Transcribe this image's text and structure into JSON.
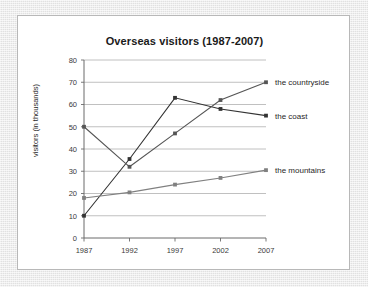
{
  "slide": {
    "panel_name": "chart-slide"
  },
  "chart_data": {
    "type": "line",
    "title": "Overseas visitors (1987-2007)",
    "xlabel": "",
    "ylabel": "visitors (in thousands)",
    "categories": [
      "1987",
      "1992",
      "1997",
      "2002",
      "2007"
    ],
    "ylim": [
      0,
      80
    ],
    "ytick_step": 10,
    "yticks": [
      "0",
      "10",
      "20",
      "30",
      "40",
      "50",
      "60",
      "70",
      "80"
    ],
    "grid": true,
    "grid_axis": "y",
    "legend_position": "right-end-labels",
    "series": [
      {
        "name": "the coast",
        "values": [
          10,
          35.5,
          63,
          58,
          55
        ],
        "color": "#333333",
        "marker": "square",
        "end_label": "the coast"
      },
      {
        "name": "the countryside",
        "values": [
          50,
          32,
          47,
          62,
          70
        ],
        "color": "#555555",
        "marker": "square",
        "end_label": "the countryside"
      },
      {
        "name": "the mountains",
        "values": [
          18,
          20.5,
          24,
          27,
          30.5
        ],
        "color": "#808080",
        "marker": "square",
        "end_label": "the mountains"
      }
    ]
  },
  "colors": {
    "background": "#e8e8e8",
    "panel": "#ffffff",
    "panel_border": "#b8b8b8",
    "gridline": "#b0b0b0",
    "axis": "#6b6b6b",
    "text": "#1a1a1a"
  }
}
